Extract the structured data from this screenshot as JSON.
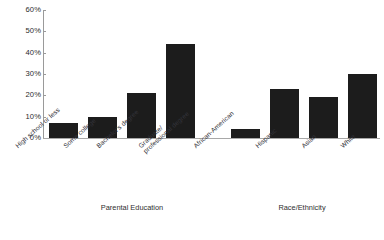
{
  "chart_data": {
    "type": "bar",
    "title": "",
    "subtitle": "",
    "xlabel": "",
    "ylabel": "",
    "ylim": [
      0,
      60
    ],
    "y_unit": "%",
    "grid": false,
    "legend": null,
    "bar_color": "#1c1c1c",
    "axis_color": "#9a9a9a",
    "y_ticks": [
      "0%",
      "10%",
      "20%",
      "30%",
      "40%",
      "50%",
      "60%"
    ],
    "y_tick_values": [
      0,
      10,
      20,
      30,
      40,
      50,
      60
    ],
    "groups": [
      {
        "name": "Parental Education",
        "categories": [
          "High school or less",
          "Some college",
          "Bachelor's degree",
          "Graduate/ professional degree"
        ],
        "values": [
          7,
          10,
          21,
          44
        ]
      },
      {
        "name": "Race/Ethnicity",
        "categories": [
          "African-American",
          "Hispanic",
          "Asian",
          "White"
        ],
        "values": [
          4,
          23,
          19,
          30
        ]
      }
    ]
  },
  "axis": {
    "y_tick_0": "0%",
    "y_tick_1": "10%",
    "y_tick_2": "20%",
    "y_tick_3": "30%",
    "y_tick_4": "40%",
    "y_tick_5": "50%",
    "y_tick_6": "60%"
  },
  "labels": {
    "cat_0": "High school or less",
    "cat_1": "Some college",
    "cat_2": "Bachelor's degree",
    "cat_3_line1": "Graduate/",
    "cat_3_line2": "professional degree",
    "cat_4": "African-American",
    "cat_5": "Hispanic",
    "cat_6": "Asian",
    "cat_7": "White",
    "group_0": "Parental Education",
    "group_1": "Race/Ethnicity"
  },
  "footer": {
    "caption": ""
  }
}
